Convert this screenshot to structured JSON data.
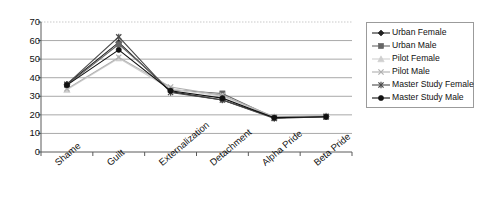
{
  "chart_data": {
    "type": "line",
    "title": "",
    "xlabel": "",
    "ylabel": "",
    "ylim": [
      0,
      70
    ],
    "ytick_step": 10,
    "grid": true,
    "legend_position": "right",
    "categories": [
      "Shame",
      "Guilt",
      "Externalization",
      "Detachment",
      "Alpha Pride",
      "Beta Pride"
    ],
    "yticks": [
      "0",
      "10",
      "20",
      "30",
      "40",
      "50",
      "60",
      "70"
    ],
    "series": [
      {
        "name": "Urban Female",
        "marker": "diamond",
        "color": "#222222",
        "values": [
          36.5,
          59.0,
          32.5,
          28.0,
          18.5,
          19.0
        ]
      },
      {
        "name": "Urban Male",
        "marker": "square",
        "color": "#666666",
        "values": [
          36.0,
          58.0,
          33.5,
          31.5,
          18.5,
          19.0
        ]
      },
      {
        "name": "Pilot Female",
        "marker": "triangle",
        "color": "#cfcfcf",
        "values": [
          33.5,
          50.5,
          34.0,
          30.0,
          19.0,
          19.5
        ]
      },
      {
        "name": "Pilot Male",
        "marker": "cross-x",
        "color": "#b0b0b0",
        "values": [
          34.0,
          51.0,
          35.0,
          30.5,
          19.0,
          19.5
        ]
      },
      {
        "name": "Master Study Female",
        "marker": "asterisk",
        "color": "#4a4a4a",
        "values": [
          36.5,
          62.0,
          32.0,
          28.0,
          18.0,
          19.0
        ]
      },
      {
        "name": "Master Study Male",
        "marker": "circle",
        "color": "#111111",
        "values": [
          36.0,
          55.0,
          33.0,
          29.0,
          18.5,
          19.0
        ]
      }
    ]
  },
  "legend": {
    "items": [
      {
        "label": "Urban Female"
      },
      {
        "label": "Urban Male"
      },
      {
        "label": "Pilot Female"
      },
      {
        "label": "Pilot Male"
      },
      {
        "label": "Master Study Female"
      },
      {
        "label": "Master Study Male"
      }
    ]
  }
}
